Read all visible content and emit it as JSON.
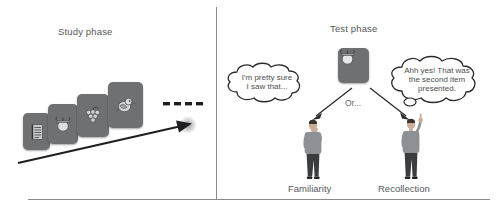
{
  "figure": {
    "type": "two-panel conceptual diagram",
    "panels": [
      "study-phase",
      "test-phase"
    ]
  },
  "study": {
    "title": "Study phase",
    "cards": [
      {
        "id": "card-1",
        "icon": "notebook-icon"
      },
      {
        "id": "card-2",
        "icon": "acorn-icon"
      },
      {
        "id": "card-3",
        "icon": "grapes-icon"
      },
      {
        "id": "card-4",
        "icon": "bird-icon"
      }
    ],
    "continuation": "....",
    "arrow": "time-arrow-right"
  },
  "test": {
    "title": "Test phase",
    "probe_card": {
      "id": "test-card",
      "icon": "acorn-icon"
    },
    "branch_label": "Or...",
    "outcomes": [
      {
        "id": "familiarity",
        "label": "Familiarity",
        "thought": "I'm pretty sure I saw that...",
        "thought_lines": [
          "I'm pretty sure",
          "I saw that..."
        ]
      },
      {
        "id": "recollection",
        "label": "Recollection",
        "thought": "Ahh yes! That was the second item presented.",
        "thought_lines": [
          "Ahh yes! That was",
          "the second item",
          "presented."
        ]
      }
    ]
  },
  "colors": {
    "text": "#58585a",
    "card": "#6e7072",
    "line": "#8a8a8c",
    "ink": "#2b2b2d",
    "shirt": "#8d9094",
    "pants": "#3b3c40"
  }
}
